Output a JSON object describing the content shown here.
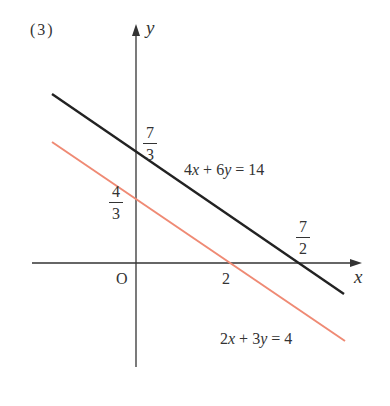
{
  "problem_label": "(3)",
  "axes": {
    "x_label": "x",
    "y_label": "y",
    "origin_label": "O"
  },
  "ticks": {
    "x_two": "2",
    "x_seven_half": {
      "num": "7",
      "den": "2"
    },
    "y_seven_third": {
      "num": "7",
      "den": "3"
    },
    "y_four_third": {
      "num": "4",
      "den": "3"
    }
  },
  "lines": [
    {
      "equation": "4x + 6y = 14",
      "color": "#222222",
      "y_intercept": "7/3",
      "x_intercept": "7/2"
    },
    {
      "equation": "2x + 3y = 4",
      "color": "#ef8a74",
      "y_intercept": "4/3",
      "x_intercept": "2"
    }
  ],
  "equation_labels": {
    "black": {
      "a": "4",
      "x": "x",
      "op1": " + ",
      "b": "6",
      "y": "y",
      "eq": " = ",
      "c": "14"
    },
    "red": {
      "a": "2",
      "x": "x",
      "op1": " + ",
      "b": "3",
      "y": "y",
      "eq": " = ",
      "c": "4"
    }
  }
}
